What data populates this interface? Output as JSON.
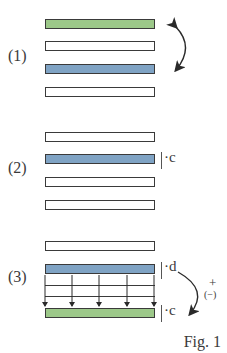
{
  "figure": {
    "caption": "Fig. 1",
    "colors": {
      "green": "#9cc889",
      "blue": "#7fa3c4",
      "outline": "#3a3a3a",
      "white": "#ffffff"
    },
    "panels": [
      {
        "label": "(1)",
        "rows": [
          "green",
          "white",
          "blue",
          "white"
        ],
        "annotation": "swap-arrow between row 1 and row 3 (row interchange)"
      },
      {
        "label": "(2)",
        "rows": [
          "white",
          "blue",
          "white",
          "white"
        ],
        "multiplier": "·c"
      },
      {
        "label": "(3)",
        "rows": [
          "white",
          "blue",
          "lines",
          "lines",
          "lines",
          "green"
        ],
        "source_multiplier": "·d",
        "target_multiplier": "·c",
        "operation_sign": "+",
        "operation_alt_sign": "(−)"
      }
    ]
  }
}
